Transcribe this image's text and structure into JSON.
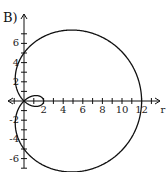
{
  "figure_label": "B)",
  "chart_data": {
    "type": "line",
    "subtype": "polar-curve",
    "title": "",
    "equation_shape": "limacon with inner loop, r = 5 + 7cos(theta)",
    "xlabel": "r",
    "ylabel": "",
    "xlim": [
      -2,
      14
    ],
    "ylim": [
      -7,
      7
    ],
    "x_ticks": [
      2,
      4,
      6,
      8,
      10,
      12
    ],
    "y_ticks": [
      -6,
      -4,
      -2,
      2,
      4,
      6
    ],
    "x_tick_labels": [
      "2",
      "4",
      "6",
      "8",
      "10",
      "12"
    ],
    "y_tick_labels": [
      "-6",
      "-4",
      "-2",
      "2",
      "4",
      "6"
    ],
    "grid": false,
    "legend": null,
    "series": [
      {
        "name": "curve",
        "a": 5,
        "b": 7,
        "color": "#111111"
      }
    ],
    "key_points": [
      {
        "x": 12,
        "y": 0
      },
      {
        "x": 0,
        "y": 5
      },
      {
        "x": 0,
        "y": -5
      },
      {
        "x": 2,
        "y": 0
      },
      {
        "x": 0,
        "y": 0
      }
    ]
  }
}
